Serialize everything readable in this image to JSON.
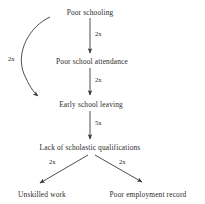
{
  "diagram": {
    "type": "flowchart",
    "orientation": "vertical",
    "background_color": "#ffffff",
    "line_color": "#3a3a3a",
    "text_color": "#2a2a2a",
    "nodes": [
      {
        "id": "poor-schooling",
        "label": "Poor schooling"
      },
      {
        "id": "poor-school-attendance",
        "label": "Poor school attendance"
      },
      {
        "id": "early-school-leaving",
        "label": "Early school leaving"
      },
      {
        "id": "lack-of-scholastic-qualifications",
        "label": "Lack of scholastic qualifications"
      },
      {
        "id": "unskilled-work",
        "label": "Unskilled work"
      },
      {
        "id": "poor-employment-record",
        "label": "Poor employment record"
      }
    ],
    "edges": [
      {
        "id": "e1",
        "from": "poor-schooling",
        "to": "poor-school-attendance",
        "label": "2x",
        "style": "straight"
      },
      {
        "id": "e2",
        "from": "poor-schooling",
        "to": "early-school-leaving",
        "label": "2x",
        "style": "curved"
      },
      {
        "id": "e3",
        "from": "poor-school-attendance",
        "to": "early-school-leaving",
        "label": "2x",
        "style": "straight"
      },
      {
        "id": "e4",
        "from": "early-school-leaving",
        "to": "lack-of-scholastic-qualifications",
        "label": "5x",
        "style": "straight"
      },
      {
        "id": "e5",
        "from": "lack-of-scholastic-qualifications",
        "to": "unskilled-work",
        "label": "2x",
        "style": "diagonal"
      },
      {
        "id": "e6",
        "from": "lack-of-scholastic-qualifications",
        "to": "poor-employment-record",
        "label": "2x",
        "style": "diagonal"
      }
    ]
  }
}
